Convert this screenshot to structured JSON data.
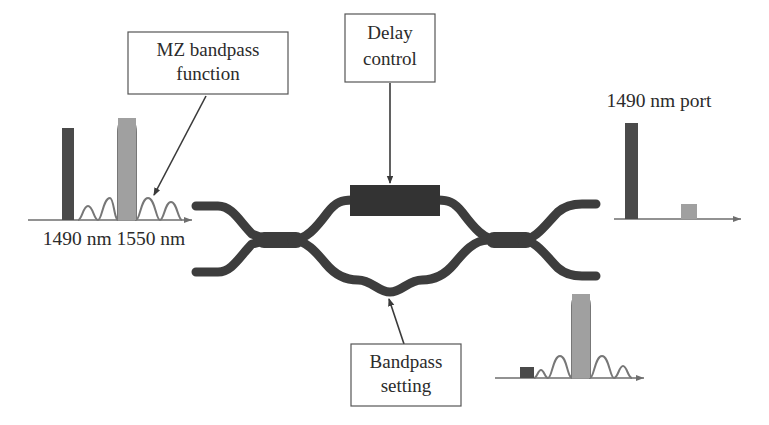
{
  "figure": {
    "background_color": "#ffffff"
  },
  "colors": {
    "dark_bar": "#4a4a4a",
    "gray_bar": "#a0a0a0",
    "waveguide": "#3d3d3d",
    "delay_block": "#333333",
    "axis": "#6e6e6e",
    "curve": "#777777",
    "callout_border": "#555555",
    "text": "#2b2b2b"
  },
  "callouts": [
    {
      "id": "mz-bandpass-function",
      "line1": "MZ bandpass",
      "line2": "function",
      "box": {
        "x": 128,
        "y": 32,
        "w": 160,
        "h": 62
      },
      "leader": {
        "x1": 205,
        "y1": 96,
        "x2": 152,
        "y2": 196
      }
    },
    {
      "id": "delay-control",
      "line1": "Delay",
      "line2": "control",
      "box": {
        "x": 345,
        "y": 14,
        "w": 90,
        "h": 68
      },
      "leader": {
        "x1": 390,
        "y1": 84,
        "x2": 390,
        "y2": 184
      }
    },
    {
      "id": "bandpass-setting",
      "line1": "Bandpass",
      "line2": "setting",
      "box": {
        "x": 351,
        "y": 344,
        "w": 110,
        "h": 62
      },
      "leader": {
        "x1": 404,
        "y1": 344,
        "x2": 388,
        "y2": 298
      }
    }
  ],
  "spectra": [
    {
      "id": "input-spectrum",
      "label": "1490 nm 1550 nm",
      "label_x": 114,
      "label_y": 240,
      "axis": {
        "x1": 28,
        "y1": 220,
        "x2": 196,
        "y2": 220
      },
      "bars": [
        {
          "name": "1490-nm-input-line",
          "x": 62,
          "width": 12,
          "height": 92,
          "color": "#4a4a4a"
        },
        {
          "name": "1550-nm-input-line",
          "x": 118,
          "width": 18,
          "height": 102,
          "color": "#a0a0a0"
        }
      ],
      "curve": {
        "name": "mz-bandpass-response",
        "center": 127,
        "peak_height": 100,
        "lobe_height": 22,
        "baseline": 220
      }
    },
    {
      "id": "port-1490-spectrum",
      "label": "1490 nm port",
      "label_x": 659,
      "label_y": 102,
      "axis": {
        "x1": 614,
        "y1": 219,
        "x2": 745,
        "y2": 219
      },
      "bars": [
        {
          "name": "1490-nm-output-line",
          "x": 625,
          "width": 13,
          "height": 96,
          "color": "#4a4a4a"
        },
        {
          "name": "1550-nm-residual-line",
          "x": 681,
          "width": 16,
          "height": 15,
          "color": "#a0a0a0"
        }
      ]
    },
    {
      "id": "port-1550-spectrum",
      "label": "",
      "axis": {
        "x1": 495,
        "y1": 378,
        "x2": 648,
        "y2": 378
      },
      "bars": [
        {
          "name": "1490-nm-residual-line",
          "x": 520,
          "width": 14,
          "height": 11,
          "color": "#4a4a4a"
        },
        {
          "name": "1550-nm-output-line",
          "x": 572,
          "width": 18,
          "height": 84,
          "color": "#a0a0a0"
        }
      ],
      "curve": {
        "name": "bandpass-setting-response",
        "center": 581,
        "peak_height": 82,
        "lobe_height": 20,
        "baseline": 378
      }
    }
  ],
  "device": {
    "name": "mach-zehnder-interferometer",
    "delay_block": {
      "x": 350,
      "y": 185,
      "w": 90,
      "h": 31
    },
    "input_ports": [
      "upper-input-waveguide",
      "lower-input-waveguide"
    ],
    "output_ports": [
      "upper-output-waveguide",
      "lower-output-waveguide"
    ],
    "couplers": [
      "left-coupler",
      "right-coupler"
    ],
    "arms": [
      "upper-arm-with-delay",
      "lower-arm-meander"
    ]
  }
}
